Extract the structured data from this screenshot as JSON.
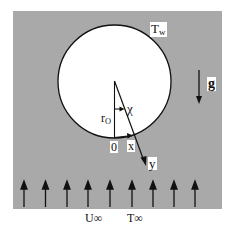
{
  "diagram": {
    "colors": {
      "field": "#a9a9a9",
      "cylinder": "#ffffff",
      "ink": "#111111",
      "page": "#ffffff"
    },
    "labels": {
      "wall_temp": {
        "main": "T",
        "sub": "w"
      },
      "gravity": "g",
      "radius": {
        "main": "r",
        "sub": "O"
      },
      "angle": "χ",
      "origin": "0",
      "x_axis": "x",
      "y_axis": "y",
      "freestream_velocity": "U∞",
      "freestream_temp": "T∞"
    },
    "freestream_arrows": {
      "count": 9
    }
  }
}
